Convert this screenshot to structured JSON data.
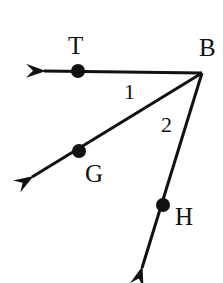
{
  "diagram": {
    "type": "geometry-angles",
    "vertex": {
      "label": "B",
      "x": 202,
      "y": 73
    },
    "rays": [
      {
        "name": "BT",
        "point_label": "T",
        "point": {
          "x": 78,
          "y": 71
        },
        "tip": {
          "x": 40,
          "y": 71
        }
      },
      {
        "name": "BG",
        "point_label": "G",
        "point": {
          "x": 79,
          "y": 151
        },
        "tip": {
          "x": 28,
          "y": 179
        }
      },
      {
        "name": "BH",
        "point_label": "H",
        "point": {
          "x": 163,
          "y": 205
        },
        "tip": {
          "x": 140,
          "y": 273
        }
      }
    ],
    "angles": [
      {
        "label": "1",
        "between": [
          "BT",
          "BG"
        ]
      },
      {
        "label": "2",
        "between": [
          "BG",
          "BH"
        ]
      }
    ],
    "stroke_color": "#111111"
  },
  "labels": {
    "T": "T",
    "B": "B",
    "G": "G",
    "H": "H",
    "angle1": "1",
    "angle2": "2"
  }
}
